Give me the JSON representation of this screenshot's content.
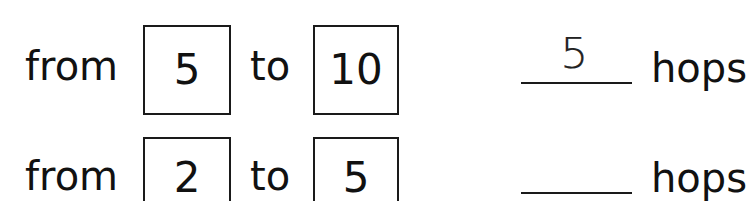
{
  "worksheet": {
    "rows": [
      {
        "from_label": "from",
        "from_value": "5",
        "to_label": "to",
        "to_value": "10",
        "answer": "5",
        "unit_label": "hops"
      },
      {
        "from_label": "from",
        "from_value": "2",
        "to_label": "to",
        "to_value": "5",
        "answer": "",
        "unit_label": "hops"
      }
    ],
    "colors": {
      "ink": "#111111",
      "box_border": "#1a1a1a",
      "background": "#ffffff"
    }
  }
}
